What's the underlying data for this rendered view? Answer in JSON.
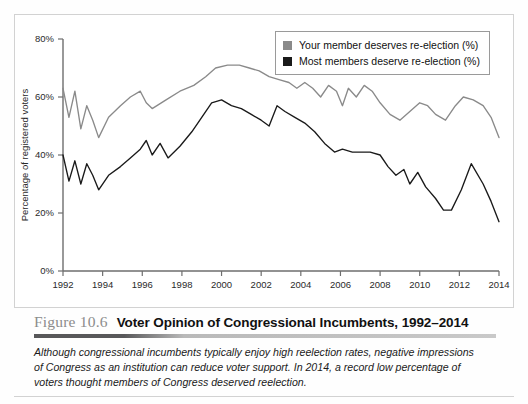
{
  "figure": {
    "number": "Figure 10.6",
    "title": "Voter Opinion of Congressional Incumbents, 1992–2014",
    "caption": "Although congressional incumbents typically enjoy high reelection rates, negative impressions of Congress as an institution can reduce voter support. In 2014, a record low percentage of voters thought members of Congress deserved reelection."
  },
  "legend": {
    "position": "top-right",
    "items": [
      {
        "label": "Your member deserves re-election (%)",
        "color": "#8a8a8a"
      },
      {
        "label": "Most members deserve re-election (%)",
        "color": "#1a1a1a"
      }
    ]
  },
  "chart_data": {
    "type": "line",
    "title": "Voter Opinion of Congressional Incumbents, 1992–2014",
    "xlabel": "",
    "ylabel": "Percentage of registered voters",
    "xlim": [
      1992,
      2014
    ],
    "ylim": [
      0,
      80
    ],
    "xticks": [
      1992,
      1994,
      1996,
      1998,
      2000,
      2002,
      2004,
      2006,
      2008,
      2010,
      2012,
      2014
    ],
    "yticks": [
      0,
      20,
      40,
      60,
      80
    ],
    "ytick_labels": [
      "0%",
      "20%",
      "40%",
      "60%",
      "80%"
    ],
    "grid": false,
    "series": [
      {
        "name": "Your member deserves re-election (%)",
        "color": "#8a8a8a",
        "points": [
          [
            1992.0,
            63
          ],
          [
            1992.3,
            53
          ],
          [
            1992.6,
            62
          ],
          [
            1992.9,
            49
          ],
          [
            1993.2,
            57
          ],
          [
            1993.5,
            52
          ],
          [
            1993.8,
            46
          ],
          [
            1994.3,
            53
          ],
          [
            1994.9,
            57
          ],
          [
            1995.4,
            60
          ],
          [
            1995.9,
            62
          ],
          [
            1996.2,
            58
          ],
          [
            1996.5,
            56
          ],
          [
            1997.2,
            59
          ],
          [
            1997.9,
            62
          ],
          [
            1998.6,
            64
          ],
          [
            1999.2,
            67
          ],
          [
            1999.7,
            70
          ],
          [
            2000.3,
            71
          ],
          [
            2000.9,
            71
          ],
          [
            2001.4,
            70
          ],
          [
            2001.9,
            69
          ],
          [
            2002.4,
            67
          ],
          [
            2002.9,
            66
          ],
          [
            2003.4,
            65
          ],
          [
            2003.8,
            63
          ],
          [
            2004.2,
            65
          ],
          [
            2004.6,
            63
          ],
          [
            2005.0,
            60
          ],
          [
            2005.4,
            64
          ],
          [
            2005.8,
            62
          ],
          [
            2006.1,
            57
          ],
          [
            2006.4,
            63
          ],
          [
            2006.8,
            60
          ],
          [
            2007.2,
            64
          ],
          [
            2007.6,
            62
          ],
          [
            2008.0,
            58
          ],
          [
            2008.5,
            54
          ],
          [
            2009.0,
            52
          ],
          [
            2009.5,
            55
          ],
          [
            2010.0,
            58
          ],
          [
            2010.4,
            57
          ],
          [
            2010.8,
            54
          ],
          [
            2011.3,
            52
          ],
          [
            2011.8,
            57
          ],
          [
            2012.2,
            60
          ],
          [
            2012.7,
            59
          ],
          [
            2013.2,
            57
          ],
          [
            2013.6,
            53
          ],
          [
            2014.0,
            46
          ]
        ]
      },
      {
        "name": "Most members deserve re-election (%)",
        "color": "#1a1a1a",
        "points": [
          [
            1992.0,
            40
          ],
          [
            1992.3,
            31
          ],
          [
            1992.6,
            38
          ],
          [
            1992.9,
            30
          ],
          [
            1993.2,
            37
          ],
          [
            1993.5,
            33
          ],
          [
            1993.8,
            28
          ],
          [
            1994.3,
            33
          ],
          [
            1994.9,
            36
          ],
          [
            1995.4,
            39
          ],
          [
            1995.9,
            42
          ],
          [
            1996.2,
            45
          ],
          [
            1996.5,
            40
          ],
          [
            1996.9,
            44
          ],
          [
            1997.3,
            39
          ],
          [
            1997.9,
            43
          ],
          [
            1998.5,
            48
          ],
          [
            1999.0,
            53
          ],
          [
            1999.5,
            58
          ],
          [
            2000.0,
            59
          ],
          [
            2000.5,
            57
          ],
          [
            2001.0,
            56
          ],
          [
            2001.5,
            54
          ],
          [
            2002.0,
            52
          ],
          [
            2002.4,
            50
          ],
          [
            2002.8,
            57
          ],
          [
            2003.2,
            55
          ],
          [
            2003.7,
            53
          ],
          [
            2004.2,
            51
          ],
          [
            2004.7,
            48
          ],
          [
            2005.2,
            44
          ],
          [
            2005.7,
            41
          ],
          [
            2006.1,
            42
          ],
          [
            2006.6,
            41
          ],
          [
            2007.0,
            41
          ],
          [
            2007.5,
            41
          ],
          [
            2008.0,
            40
          ],
          [
            2008.4,
            36
          ],
          [
            2008.8,
            33
          ],
          [
            2009.2,
            35
          ],
          [
            2009.5,
            30
          ],
          [
            2009.9,
            34
          ],
          [
            2010.3,
            29
          ],
          [
            2010.8,
            25
          ],
          [
            2011.2,
            21
          ],
          [
            2011.6,
            21
          ],
          [
            2012.1,
            28
          ],
          [
            2012.6,
            37
          ],
          [
            2013.2,
            30
          ],
          [
            2013.6,
            24
          ],
          [
            2014.0,
            17
          ]
        ]
      }
    ]
  }
}
